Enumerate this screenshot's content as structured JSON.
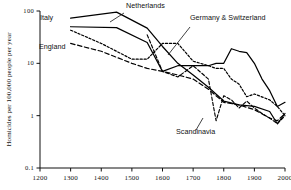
{
  "chart_data": {
    "type": "line",
    "title": "",
    "xlabel": "",
    "ylabel": "Homicides per 100,000 people per year",
    "yscale": "log",
    "xlim": [
      1200,
      2000
    ],
    "ylim": [
      0.1,
      100
    ],
    "xticks": [
      1200,
      1300,
      1400,
      1500,
      1600,
      1700,
      1800,
      1900,
      2000
    ],
    "xtick_labels": [
      "1200",
      "1300",
      "1400",
      "1500",
      "1600",
      "1700",
      "1800",
      "1900",
      "2000"
    ],
    "yticks": [
      0.1,
      1,
      10,
      100
    ],
    "ytick_labels": [
      "0.1",
      "1",
      "10",
      "100"
    ],
    "grid": false,
    "legend_position": "inline-annotations",
    "series": [
      {
        "name": "Italy",
        "style": "solid",
        "x": [
          1300,
          1450,
          1550,
          1600,
          1650,
          1700,
          1750,
          1775,
          1800,
          1825,
          1850,
          1875,
          1900,
          1925,
          1950,
          1975,
          2000
        ],
        "values": [
          50,
          48,
          25,
          7,
          9,
          9,
          9,
          10,
          10,
          19,
          17,
          16,
          10,
          5,
          3,
          1.5,
          1.8
        ]
      },
      {
        "name": "Netherlands",
        "style": "solid",
        "x": [
          1300,
          1450,
          1550,
          1600,
          1650,
          1700,
          1750,
          1800,
          1850,
          1900,
          1950,
          1975,
          2000
        ],
        "values": [
          73,
          95,
          47,
          21,
          10,
          6,
          3.5,
          1.9,
          1.6,
          1.5,
          1.2,
          0.7,
          1.1
        ]
      },
      {
        "name": "England",
        "style": "dashed",
        "x": [
          1300,
          1400,
          1500,
          1550,
          1600,
          1650,
          1700,
          1750,
          1800,
          1850,
          1900,
          1950,
          1975,
          2000
        ],
        "values": [
          24,
          17,
          10,
          8,
          7,
          6,
          5,
          3.2,
          1.8,
          1.6,
          1.3,
          0.9,
          0.8,
          1.1
        ]
      },
      {
        "name": "Germany & Switzerland",
        "style": "dotted",
        "x": [
          1300,
          1400,
          1500,
          1550,
          1600,
          1650,
          1700,
          1750,
          1775,
          1800,
          1825,
          1850,
          1875,
          1900,
          1950,
          1975,
          2000
        ],
        "values": [
          43,
          24,
          12,
          12,
          24,
          24,
          11,
          9,
          8,
          8,
          5,
          4,
          2.3,
          2.6,
          2.0,
          1.5,
          1.0
        ]
      },
      {
        "name": "Scandinavia",
        "style": "dashdot",
        "x": [
          1550,
          1600,
          1650,
          1700,
          1750,
          1775,
          1800,
          1825,
          1850,
          1875,
          1900,
          1925,
          1950,
          1975,
          2000
        ],
        "values": [
          35,
          7,
          5.5,
          9,
          5,
          0.8,
          2.4,
          2.0,
          1.4,
          1.9,
          1.4,
          1.1,
          0.9,
          0.7,
          1.0
        ]
      }
    ],
    "annotations": [
      {
        "label": "Italy",
        "x": 40,
        "y": 20
      },
      {
        "label": "Netherlands",
        "x": 126,
        "y": 8
      },
      {
        "label": "England",
        "x": 39,
        "y": 49
      },
      {
        "label": "Germany & Switzerland",
        "x": 190,
        "y": 20
      },
      {
        "label": "Scandinavia",
        "x": 176,
        "y": 134
      }
    ]
  }
}
